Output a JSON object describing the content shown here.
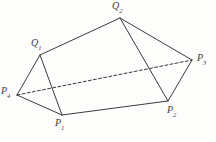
{
  "figure": {
    "background_color": "#fdfdfb",
    "line_color": "#3b3b3b",
    "label_color": "#3b3b3b",
    "solid_line_width": 1,
    "dashed_line_width": 1,
    "dash_pattern": "3,2.2"
  },
  "vertices": [
    {
      "id": "Q2",
      "base": "Q",
      "sub": "2",
      "x": 120,
      "y": 18,
      "label_x": 112,
      "label_y": 1
    },
    {
      "id": "Q1",
      "base": "Q",
      "sub": "1",
      "x": 40,
      "y": 55,
      "label_x": 31,
      "label_y": 38
    },
    {
      "id": "P3",
      "base": "P",
      "sub": "3",
      "x": 192,
      "y": 60,
      "label_x": 197,
      "label_y": 53
    },
    {
      "id": "P4",
      "base": "P",
      "sub": "4",
      "x": 17,
      "y": 95,
      "label_x": 1,
      "label_y": 86
    },
    {
      "id": "P2",
      "base": "P",
      "sub": "2",
      "x": 168,
      "y": 101,
      "label_x": 167,
      "label_y": 105
    },
    {
      "id": "P1",
      "base": "P",
      "sub": "1",
      "x": 62,
      "y": 115,
      "label_x": 55,
      "label_y": 118
    }
  ],
  "edges": {
    "solid": [
      {
        "name": "edge-P4-P1",
        "from": "P4",
        "to": "P1",
        "x1": 17,
        "y1": 95,
        "x2": 62,
        "y2": 115
      },
      {
        "name": "edge-P1-P2",
        "from": "P1",
        "to": "P2",
        "x1": 62,
        "y1": 115,
        "x2": 168,
        "y2": 101
      },
      {
        "name": "edge-P2-P3",
        "from": "P2",
        "to": "P3",
        "x1": 168,
        "y1": 101,
        "x2": 192,
        "y2": 60
      },
      {
        "name": "edge-P4-Q1",
        "from": "P4",
        "to": "Q1",
        "x1": 17,
        "y1": 95,
        "x2": 40,
        "y2": 55
      },
      {
        "name": "edge-Q1-Q2",
        "from": "Q1",
        "to": "Q2",
        "x1": 40,
        "y1": 55,
        "x2": 120,
        "y2": 18
      },
      {
        "name": "edge-Q2-P3",
        "from": "Q2",
        "to": "P3",
        "x1": 120,
        "y1": 18,
        "x2": 192,
        "y2": 60
      },
      {
        "name": "edge-Q1-P1",
        "from": "Q1",
        "to": "P1",
        "x1": 40,
        "y1": 55,
        "x2": 62,
        "y2": 115
      },
      {
        "name": "edge-Q2-P2",
        "from": "Q2",
        "to": "P2",
        "x1": 120,
        "y1": 18,
        "x2": 168,
        "y2": 101
      }
    ],
    "dashed": [
      {
        "name": "edge-P4-P3-hidden",
        "from": "P4",
        "to": "P3",
        "x1": 17,
        "y1": 95,
        "x2": 192,
        "y2": 60
      }
    ]
  }
}
